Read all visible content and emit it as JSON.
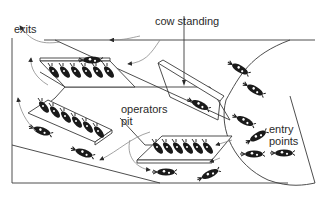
{
  "diagram": {
    "labels": {
      "exits": "exits",
      "cow_standing": "cow standing",
      "operators_pit": "operators\npit",
      "operators_line1": "operators",
      "operators_line2": "pit",
      "entry_line1": "entry",
      "entry_line2": "points"
    },
    "components": [
      {
        "name": "milking-platform-top-left",
        "cows": 6
      },
      {
        "name": "milking-platform-left",
        "cows": 6
      },
      {
        "name": "milking-platform-bottom-right",
        "cows": 6
      },
      {
        "name": "operators-pit",
        "cows": 0
      },
      {
        "name": "cow-standing-area",
        "cows": 0
      },
      {
        "name": "entry-holding-area",
        "cows": 7
      }
    ],
    "flows": [
      "entry points → milking platforms",
      "milking platforms → exits"
    ],
    "colors": {
      "line": "#3a3a3a",
      "arrow": "#8a8a8a",
      "cow": "#1a1a1a",
      "background": "#ffffff"
    }
  }
}
